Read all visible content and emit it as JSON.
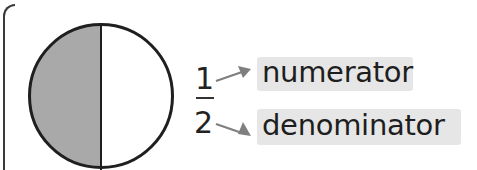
{
  "diagram": {
    "shape": {
      "type": "circle",
      "parts": 2,
      "shaded_parts": 1,
      "shaded_color": "#a9a9a9",
      "outline_color": "#1f1f1f"
    },
    "fraction": {
      "numerator": "1",
      "denominator": "2"
    },
    "labels": {
      "numerator": "numerator",
      "denominator": "denominator"
    },
    "colors": {
      "arrow": "#7f7f7f",
      "label_highlight": "#e6e6e6",
      "text": "#1e1e1e"
    }
  }
}
